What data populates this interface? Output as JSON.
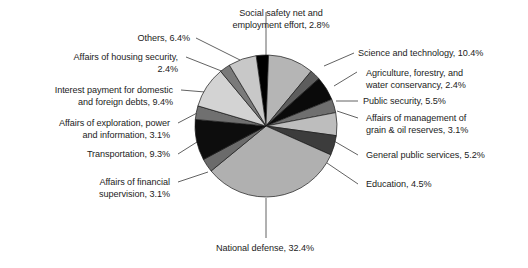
{
  "chart_data": {
    "type": "pie",
    "title": "",
    "subtitle": "",
    "xlabel": "",
    "ylabel": "",
    "legend_position": "none",
    "grid": false,
    "units": "percent",
    "start_angle_deg": -8,
    "direction": "clockwise",
    "categories": [
      "Social safety net and employment effort",
      "Science and technology",
      "Agriculture, forestry, and water conservancy",
      "Public security",
      "Affairs of management of grain & oil reserves",
      "General public services",
      "Education",
      "National defense",
      "Affairs of financial supervision",
      "Transportation",
      "Affairs of exploration, power and information",
      "Interest payment for domestic and foreign debts",
      "Affairs of housing security",
      "Others"
    ],
    "values": [
      2.8,
      10.4,
      2.4,
      5.5,
      3.1,
      5.2,
      4.5,
      32.4,
      3.1,
      9.3,
      3.1,
      9.4,
      2.4,
      6.4
    ],
    "colors": [
      "#000000",
      "#b5b5b5",
      "#5d5d5d",
      "#0a0a0a",
      "#6f6f6f",
      "#bdbdbd",
      "#3c3c3c",
      "#b0b0b0",
      "#6b6b6b",
      "#0d0d0d",
      "#707070",
      "#d3d3d3",
      "#7a7a7a",
      "#c8c8c8"
    ],
    "slice_stroke": "#1a1a1a",
    "labels": [
      {
        "id": "social-safety-net",
        "text": "Social safety net and\nemployment effort, 2.8%",
        "value": 2.8
      },
      {
        "id": "science-and-technology",
        "text": "Science and technology, 10.4%",
        "value": 10.4
      },
      {
        "id": "agriculture-forestry-water",
        "text": "Agriculture, forestry, and\nwater conservancy, 2.4%",
        "value": 2.4
      },
      {
        "id": "public-security",
        "text": "Public security, 5.5%",
        "value": 5.5
      },
      {
        "id": "grain-oil-reserves",
        "text": "Affairs of management of\ngrain & oil reserves, 3.1%",
        "value": 3.1
      },
      {
        "id": "general-public-services",
        "text": "General public services, 5.2%",
        "value": 5.2
      },
      {
        "id": "education",
        "text": "Education, 4.5%",
        "value": 4.5
      },
      {
        "id": "national-defense",
        "text": "National defense, 32.4%",
        "value": 32.4
      },
      {
        "id": "financial-supervision",
        "text": "Affairs of financial\nsupervision, 3.1%",
        "value": 3.1
      },
      {
        "id": "transportation",
        "text": "Transportation, 9.3%",
        "value": 9.3
      },
      {
        "id": "exploration-power-information",
        "text": "Affairs of exploration, power\nand information, 3.1%",
        "value": 3.1
      },
      {
        "id": "interest-payment-debts",
        "text": "Interest payment for domestic\nand foreign debts, 9.4%",
        "value": 9.4
      },
      {
        "id": "housing-security",
        "text": "Affairs of housing security,\n2.4%",
        "value": 2.4
      },
      {
        "id": "others",
        "text": "Others, 6.4%",
        "value": 6.4
      }
    ]
  },
  "geometry": {
    "cx": 266,
    "cy": 126,
    "r": 71
  }
}
